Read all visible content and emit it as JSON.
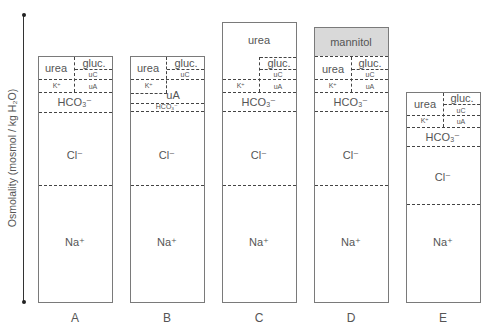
{
  "figure": {
    "y_axis_label": "Osmolality (mosmol / kg H₂O)",
    "columns": [
      {
        "id": "A",
        "label": "A",
        "segments": {
          "urea": "urea",
          "gluc": "gluc.",
          "uC": "uC",
          "K": "K⁺",
          "uA": "uA",
          "HCO3": "HCO₃⁻",
          "Cl": "Cl⁻",
          "Na": "Na⁺"
        }
      },
      {
        "id": "B",
        "label": "B",
        "segments": {
          "urea": "urea",
          "gluc": "gluc.",
          "uC": "uC",
          "K": "K⁺",
          "uA": "uA",
          "HCO3": "HCO₃⁻",
          "Cl": "Cl⁻",
          "Na": "Na⁺"
        }
      },
      {
        "id": "C",
        "label": "C",
        "segments": {
          "urea": "urea",
          "gluc": "gluc.",
          "uC": "uC",
          "K": "K⁺",
          "uA": "uA",
          "HCO3": "HCO₃⁻",
          "Cl": "Cl⁻",
          "Na": "Na⁺"
        }
      },
      {
        "id": "D",
        "label": "D",
        "segments": {
          "mannitol": "mannitol",
          "urea": "urea",
          "gluc": "gluc.",
          "uC": "uC",
          "K": "K⁺",
          "uA": "uA",
          "HCO3": "HCO₃⁻",
          "Cl": "Cl⁻",
          "Na": "Na⁺"
        }
      },
      {
        "id": "E",
        "label": "E",
        "segments": {
          "urea": "urea",
          "gluc": "gluc.",
          "uC": "uC",
          "K": "K⁺",
          "uA": "uA",
          "HCO3": "HCO₃⁻",
          "Cl": "Cl⁻",
          "Na": "Na⁺"
        }
      }
    ],
    "colors": {
      "mannitol_fill": "#d9d9d9",
      "border": "#7a7a7a",
      "dash": "#444444",
      "text": "#555555"
    }
  }
}
